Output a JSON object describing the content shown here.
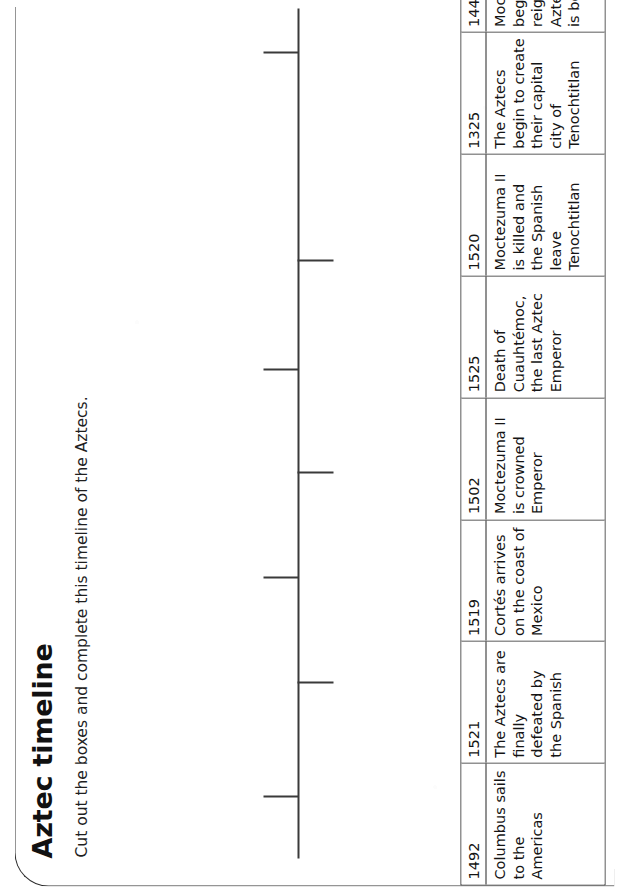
{
  "worksheet": {
    "title": "Aztec timeline",
    "instruction": "Cut out the boxes and complete this timeline of the Aztecs."
  },
  "timeline": {
    "axis_label": "timeline-axis",
    "tick_count": 7,
    "ticks": [
      {
        "id": "tick-1",
        "direction": "up",
        "position_pct": 7.2
      },
      {
        "id": "tick-2",
        "direction": "down",
        "position_pct": 20.6
      },
      {
        "id": "tick-3",
        "direction": "up",
        "position_pct": 32.9
      },
      {
        "id": "tick-4",
        "direction": "down",
        "position_pct": 45.3
      },
      {
        "id": "tick-5",
        "direction": "up",
        "position_pct": 57.4
      },
      {
        "id": "tick-6",
        "direction": "down",
        "position_pct": 70.2
      },
      {
        "id": "tick-7",
        "direction": "up",
        "position_pct": 94.7
      }
    ]
  },
  "boxes": [
    {
      "year": "1492",
      "text": "Columbus sails to the Americas"
    },
    {
      "year": "1521",
      "text": "The Aztecs are finally defeated by the Spanish"
    },
    {
      "year": "1519",
      "text": "Cortés arrives on the coast of Mexico"
    },
    {
      "year": "1502",
      "text": "Moctezuma II is crowned Emperor"
    },
    {
      "year": "1525",
      "text": "Death of Cuauhtémoc, the last Aztec Emperor"
    },
    {
      "year": "1520",
      "text": "Moctezuma II is killed and the Spanish leave Tenochtitlan"
    },
    {
      "year": "1325",
      "text": "The Aztecs begin to create their capital city of Tenochtitlan"
    },
    {
      "year": "1440",
      "text": "Moctezuma I begins his reign and the Aztec Empire is born"
    }
  ],
  "colors": {
    "ink": "#141414",
    "rule": "#242424",
    "axis": "#3a3a3a",
    "paper": "#ffffff"
  }
}
